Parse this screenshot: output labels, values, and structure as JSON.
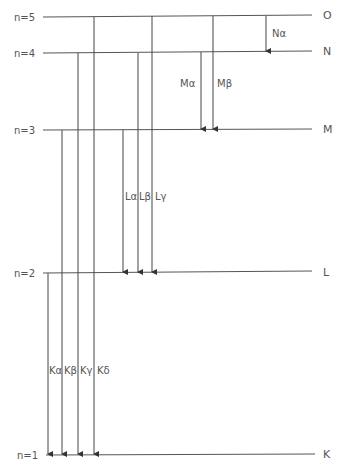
{
  "diagram": {
    "levels": [
      {
        "n_label": "n=5",
        "shell": "O",
        "y": 17
      },
      {
        "n_label": "n=4",
        "shell": "N",
        "y": 52
      },
      {
        "n_label": "n=3",
        "shell": "M",
        "y": 129
      },
      {
        "n_label": "n=2",
        "shell": "L",
        "y": 272
      },
      {
        "n_label": "n=1",
        "shell": "K",
        "y": 454
      }
    ],
    "transitions": [
      {
        "label": "Kα",
        "from": "L",
        "to": "K",
        "x": 48
      },
      {
        "label": "Kβ",
        "from": "M",
        "to": "K",
        "x": 62
      },
      {
        "label": "Kγ",
        "from": "N",
        "to": "K",
        "x": 78
      },
      {
        "label": "Kδ",
        "from": "O",
        "to": "K",
        "x": 94
      },
      {
        "label": "Lα",
        "from": "M",
        "to": "L",
        "x": 123
      },
      {
        "label": "Lβ",
        "from": "N",
        "to": "L",
        "x": 138
      },
      {
        "label": "Lγ",
        "from": "O",
        "to": "L",
        "x": 153
      },
      {
        "label": "Mα",
        "from": "N",
        "to": "M",
        "x": 201
      },
      {
        "label": "Mβ",
        "from": "O",
        "to": "M",
        "x": 213
      },
      {
        "label": "Nα",
        "from": "O",
        "to": "N",
        "x": 266
      }
    ]
  }
}
